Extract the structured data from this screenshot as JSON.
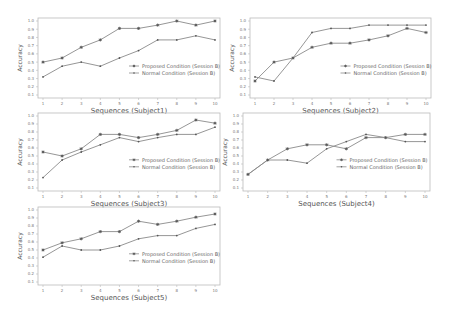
{
  "figure": {
    "legend": {
      "proposed": "Proposed Condition (Session B)",
      "normal": "Normal Condition (Session B)"
    },
    "ylabel": "Accuracy",
    "colors": {
      "proposed": "#8a8a8a",
      "normal": "#8a8a8a",
      "axis": "#bbbbbb",
      "text": "#666666"
    }
  },
  "chart_data": [
    {
      "type": "line",
      "title": "",
      "xlabel": "Sequences (Subject1)",
      "ylabel": "Accuracy",
      "x": [
        1,
        2,
        3,
        4,
        5,
        6,
        7,
        8,
        9,
        10
      ],
      "ylim": [
        0.1,
        1.0
      ],
      "yticks": [
        0.1,
        0.2,
        0.3,
        0.4,
        0.5,
        0.6,
        0.7,
        0.8,
        0.9,
        1.0
      ],
      "series": [
        {
          "name": "Proposed Condition (Session B)",
          "marker": "star",
          "values": [
            0.5,
            0.55,
            0.68,
            0.77,
            0.91,
            0.91,
            0.95,
            1.0,
            0.95,
            1.0
          ]
        },
        {
          "name": "Normal Condition (Session B)",
          "marker": "dot",
          "values": [
            0.32,
            0.45,
            0.5,
            0.45,
            0.55,
            0.64,
            0.77,
            0.77,
            0.82,
            0.77
          ]
        }
      ],
      "legend_position": "center right",
      "grid": false
    },
    {
      "type": "line",
      "title": "",
      "xlabel": "Sequences (Subject2)",
      "ylabel": "Accuracy",
      "x": [
        1,
        2,
        3,
        4,
        5,
        6,
        7,
        8,
        9,
        10
      ],
      "ylim": [
        0.1,
        1.0
      ],
      "yticks": [
        0.1,
        0.2,
        0.3,
        0.4,
        0.5,
        0.6,
        0.7,
        0.8,
        0.9,
        1.0
      ],
      "series": [
        {
          "name": "Proposed Condition (Session B)",
          "marker": "star",
          "values": [
            0.27,
            0.5,
            0.55,
            0.68,
            0.73,
            0.73,
            0.77,
            0.82,
            0.91,
            0.86
          ]
        },
        {
          "name": "Normal Condition (Session B)",
          "marker": "dot",
          "values": [
            0.32,
            0.27,
            0.55,
            0.86,
            0.91,
            0.91,
            0.95,
            0.95,
            0.95,
            0.95
          ]
        }
      ],
      "legend_position": "center right",
      "grid": false
    },
    {
      "type": "line",
      "title": "",
      "xlabel": "Sequences (Subject3)",
      "ylabel": "Accuracy",
      "x": [
        1,
        2,
        3,
        4,
        5,
        6,
        7,
        8,
        9,
        10
      ],
      "ylim": [
        0.1,
        1.0
      ],
      "yticks": [
        0.1,
        0.2,
        0.3,
        0.4,
        0.5,
        0.6,
        0.7,
        0.8,
        0.9,
        1.0
      ],
      "series": [
        {
          "name": "Proposed Condition (Session B)",
          "marker": "star",
          "values": [
            0.55,
            0.5,
            0.59,
            0.77,
            0.77,
            0.73,
            0.77,
            0.82,
            0.95,
            0.91
          ]
        },
        {
          "name": "Normal Condition (Session B)",
          "marker": "dot",
          "values": [
            0.23,
            0.45,
            0.55,
            0.64,
            0.73,
            0.68,
            0.73,
            0.77,
            0.77,
            0.86
          ]
        }
      ],
      "legend_position": "center right",
      "grid": false
    },
    {
      "type": "line",
      "title": "",
      "xlabel": "Sequences (Subject4)",
      "ylabel": "Accuracy",
      "x": [
        1,
        2,
        3,
        4,
        5,
        6,
        7,
        8,
        9,
        10
      ],
      "ylim": [
        0.1,
        1.0
      ],
      "yticks": [
        0.1,
        0.2,
        0.3,
        0.4,
        0.5,
        0.6,
        0.7,
        0.8,
        0.9,
        1.0
      ],
      "series": [
        {
          "name": "Proposed Condition (Session B)",
          "marker": "star",
          "values": [
            0.27,
            0.45,
            0.59,
            0.64,
            0.64,
            0.59,
            0.73,
            0.73,
            0.77,
            0.77
          ]
        },
        {
          "name": "Normal Condition (Session B)",
          "marker": "dot",
          "values": [
            0.27,
            0.45,
            0.45,
            0.41,
            0.59,
            0.68,
            0.77,
            0.73,
            0.68,
            0.68
          ]
        }
      ],
      "legend_position": "center right",
      "grid": false
    },
    {
      "type": "line",
      "title": "",
      "xlabel": "Sequences (Subject5)",
      "ylabel": "Accuracy",
      "x": [
        1,
        2,
        3,
        4,
        5,
        6,
        7,
        8,
        9,
        10
      ],
      "ylim": [
        0.1,
        1.0
      ],
      "yticks": [
        0.1,
        0.2,
        0.3,
        0.4,
        0.5,
        0.6,
        0.7,
        0.8,
        0.9,
        1.0
      ],
      "series": [
        {
          "name": "Proposed Condition (Session B)",
          "marker": "star",
          "values": [
            0.5,
            0.59,
            0.64,
            0.73,
            0.73,
            0.86,
            0.82,
            0.86,
            0.91,
            0.95
          ]
        },
        {
          "name": "Normal Condition (Session B)",
          "marker": "dot",
          "values": [
            0.41,
            0.55,
            0.5,
            0.5,
            0.55,
            0.64,
            0.68,
            0.68,
            0.77,
            0.82
          ]
        }
      ],
      "legend_position": "center right",
      "grid": false
    }
  ],
  "layout": [
    {
      "left": 38,
      "top": 18,
      "width": 182,
      "height": 80
    },
    {
      "left": 250,
      "top": 18,
      "width": 181,
      "height": 80
    },
    {
      "left": 38,
      "top": 113,
      "width": 182,
      "height": 78
    },
    {
      "left": 243,
      "top": 113,
      "width": 187,
      "height": 78
    },
    {
      "left": 38,
      "top": 207,
      "width": 182,
      "height": 78
    }
  ]
}
